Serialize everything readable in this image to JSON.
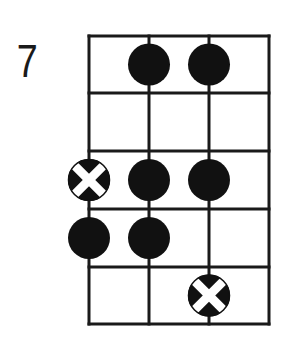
{
  "diagram": {
    "type": "fretboard-scale-diagram",
    "start_fret_label": "7",
    "strings": 4,
    "frets": 5,
    "colors": {
      "line": "#1a1a1a",
      "dot": "#111111",
      "root_cross": "#ffffff",
      "background": "#ffffff"
    },
    "geometry": {
      "string_x": [
        89,
        149,
        209,
        269
      ],
      "fret_y": [
        36,
        93,
        151,
        209,
        267,
        324
      ],
      "dot_radius": 21,
      "line_width": 3
    },
    "dots": [
      {
        "fret": 1,
        "string": 2,
        "type": "note"
      },
      {
        "fret": 1,
        "string": 3,
        "type": "note"
      },
      {
        "fret": 3,
        "string": 1,
        "type": "root"
      },
      {
        "fret": 3,
        "string": 2,
        "type": "note"
      },
      {
        "fret": 3,
        "string": 3,
        "type": "note"
      },
      {
        "fret": 4,
        "string": 1,
        "type": "note"
      },
      {
        "fret": 4,
        "string": 2,
        "type": "note"
      },
      {
        "fret": 5,
        "string": 3,
        "type": "root"
      }
    ]
  }
}
